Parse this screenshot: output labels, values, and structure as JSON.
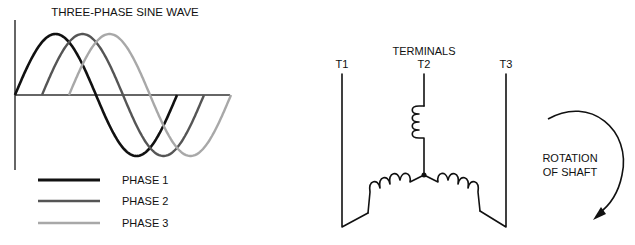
{
  "sine_wave": {
    "title": "THREE-PHASE SINE WAVE",
    "phases": [
      {
        "label": "PHASE 1",
        "color": "#111111",
        "phase_shift_deg": 0
      },
      {
        "label": "PHASE 2",
        "color": "#555555",
        "phase_shift_deg": 120
      },
      {
        "label": "PHASE 3",
        "color": "#a8a8a8",
        "phase_shift_deg": 240
      }
    ]
  },
  "wye_diagram": {
    "heading": "TERMINALS",
    "terminals": [
      "T1",
      "T2",
      "T3"
    ]
  },
  "rotation": {
    "line1": "ROTATION",
    "line2": "OF SHAFT",
    "direction": "clockwise"
  }
}
